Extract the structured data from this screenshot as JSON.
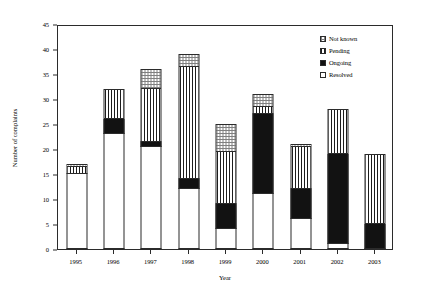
{
  "chart_data": {
    "type": "bar",
    "subtype": "stacked-vertical",
    "title": "",
    "xlabel": "Year",
    "ylabel": "Number of complaints",
    "categories": [
      "1995",
      "1996",
      "1997",
      "1998",
      "1999",
      "2000",
      "2001",
      "2002",
      "2003"
    ],
    "ylim": [
      0,
      45
    ],
    "yticks": [
      0,
      5,
      10,
      15,
      20,
      25,
      30,
      35,
      40,
      45
    ],
    "grid": false,
    "legend_position": "top-right",
    "series": [
      {
        "name": "Resolved",
        "pattern": "white",
        "values": [
          15,
          23,
          20.5,
          12,
          4,
          11,
          6,
          1,
          0
        ]
      },
      {
        "name": "Ongoing",
        "pattern": "solid-black",
        "values": [
          0,
          3,
          1,
          2,
          5,
          16,
          6,
          18,
          5
        ]
      },
      {
        "name": "Pending",
        "pattern": "vertical-lines",
        "values": [
          1.5,
          6,
          10.5,
          22.5,
          10.5,
          1.5,
          8.5,
          9,
          14
        ]
      },
      {
        "name": "Not known",
        "pattern": "checkered",
        "values": [
          0.5,
          0,
          4,
          2.5,
          5.5,
          2.5,
          0.5,
          0,
          0
        ]
      }
    ],
    "totals": [
      17,
      32,
      36,
      39,
      25,
      31,
      21,
      28,
      19
    ]
  },
  "legend": {
    "items": [
      {
        "label": "Not known",
        "pattern": "checkered"
      },
      {
        "label": "Pending",
        "pattern": "vertical-lines"
      },
      {
        "label": "Ongoing",
        "pattern": "solid-black"
      },
      {
        "label": "Resolved",
        "pattern": "white"
      }
    ]
  },
  "axes": {
    "y_title": "Number of complaints",
    "x_title": "Year"
  },
  "colors": {
    "axis": "#2b2b2b",
    "ongoing": "#121212",
    "pending": "#1d1d1d",
    "notknown": "#808080",
    "resolved": "#ffffff",
    "background": "#ffffff"
  }
}
